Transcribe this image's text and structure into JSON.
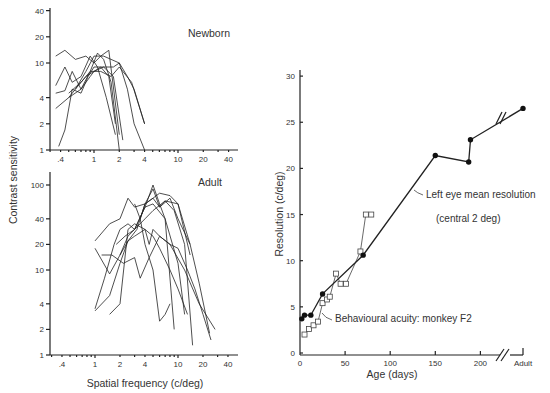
{
  "chart_data": [
    {
      "id": "newborn",
      "type": "line",
      "title": "Newborn",
      "xlabel": "Spatial frequency (c/deg)",
      "ylabel": "Contrast sensitivity",
      "xscale": "log",
      "yscale": "log",
      "xticks": [
        0.4,
        1,
        2,
        4,
        10,
        20,
        40
      ],
      "xtick_labels": [
        ".4",
        "1",
        "2",
        "4",
        "10",
        "20",
        "40"
      ],
      "yticks": [
        1,
        2,
        4,
        10,
        20,
        40
      ],
      "ytick_labels": [
        "1",
        "2",
        "4",
        "10",
        "20",
        "40"
      ],
      "xlim": [
        0.3,
        40
      ],
      "ylim": [
        1,
        40
      ],
      "series": [
        {
          "name": "n1",
          "x": [
            0.35,
            0.45,
            0.6,
            0.8,
            1.0,
            1.2,
            1.5,
            2.0
          ],
          "y": [
            12,
            14,
            11,
            12,
            10,
            12,
            14,
            1.5
          ]
        },
        {
          "name": "n2",
          "x": [
            0.35,
            0.45,
            0.55,
            0.7,
            0.9,
            1.1,
            1.4,
            1.8
          ],
          "y": [
            5.5,
            9,
            6,
            7,
            12,
            9,
            4,
            1.5
          ]
        },
        {
          "name": "n3",
          "x": [
            0.35,
            0.45,
            0.55,
            0.7,
            0.9,
            1.1,
            1.3,
            1.6,
            2.0
          ],
          "y": [
            4.5,
            4.8,
            8,
            5,
            8,
            13,
            11,
            6,
            1
          ]
        },
        {
          "name": "n4",
          "x": [
            0.35,
            0.5,
            0.7,
            0.9,
            1.0,
            1.2,
            1.5,
            1.8
          ],
          "y": [
            3,
            4,
            5,
            7,
            8,
            9,
            7,
            2
          ]
        },
        {
          "name": "n5",
          "x": [
            0.38,
            0.45,
            0.55,
            0.7,
            0.85,
            1.0,
            1.3,
            1.7,
            2.2
          ],
          "y": [
            1.1,
            1.7,
            5,
            4.5,
            7,
            9,
            9,
            7,
            1.3
          ]
        },
        {
          "name": "n6",
          "x": [
            0.5,
            0.6,
            0.8,
            1.0,
            1.3,
            2.0,
            2.5,
            3.0,
            4.0
          ],
          "y": [
            4,
            5,
            8,
            12,
            12,
            10,
            7,
            5,
            2
          ]
        },
        {
          "name": "n7",
          "x": [
            0.6,
            0.8,
            1.0,
            1.3,
            1.7,
            2.0,
            2.5,
            3.0,
            4.0
          ],
          "y": [
            5,
            7,
            8,
            9,
            9,
            10,
            5,
            2,
            1
          ]
        },
        {
          "name": "n8",
          "x": [
            0.5,
            0.7,
            0.9,
            1.2,
            1.6,
            2.0,
            2.8,
            4.0
          ],
          "y": [
            4.5,
            6,
            8,
            8,
            7,
            9,
            6,
            2
          ]
        }
      ]
    },
    {
      "id": "adult",
      "type": "line",
      "title": "Adult",
      "xlabel": "Spatial frequency (c/deg)",
      "ylabel": "Contrast sensitivity",
      "xscale": "log",
      "yscale": "log",
      "xticks": [
        0.4,
        1,
        2,
        4,
        10,
        20,
        40
      ],
      "xtick_labels": [
        ".4",
        "1",
        "2",
        "4",
        "10",
        "20",
        "40"
      ],
      "yticks": [
        1,
        2,
        4,
        10,
        20,
        40,
        100
      ],
      "ytick_labels": [
        "1",
        "2",
        "4",
        "10",
        "20",
        "40",
        "100"
      ],
      "xlim": [
        0.3,
        40
      ],
      "ylim": [
        1,
        120
      ],
      "series": [
        {
          "name": "a1",
          "x": [
            1,
            1.5,
            2,
            2.5,
            3,
            4,
            5,
            6,
            8,
            10,
            14
          ],
          "y": [
            22,
            35,
            40,
            70,
            55,
            60,
            90,
            55,
            70,
            40,
            20
          ]
        },
        {
          "name": "a2",
          "x": [
            1,
            1.3,
            1.7,
            2,
            2.5,
            3,
            4,
            5,
            7,
            10,
            12
          ],
          "y": [
            3.5,
            8,
            20,
            30,
            35,
            30,
            55,
            60,
            40,
            12,
            3
          ]
        },
        {
          "name": "a3",
          "x": [
            1,
            1.5,
            2,
            2.5,
            3,
            4,
            5,
            7,
            10,
            14
          ],
          "y": [
            18,
            9,
            15,
            25,
            30,
            40,
            50,
            65,
            60,
            15
          ]
        },
        {
          "name": "a4",
          "x": [
            1,
            1.5,
            2,
            2.5,
            3.2,
            4,
            5,
            6,
            7,
            9,
            12,
            15
          ],
          "y": [
            3.3,
            5,
            12,
            22,
            30,
            60,
            70,
            55,
            65,
            50,
            20,
            1.3
          ]
        },
        {
          "name": "a5",
          "x": [
            1.5,
            2,
            2.5,
            3,
            4,
            4.5,
            5,
            6,
            8,
            10,
            13,
            16,
            20,
            25
          ],
          "y": [
            3,
            4,
            30,
            35,
            30,
            20,
            30,
            25,
            20,
            18,
            10,
            6,
            3,
            1.5
          ]
        },
        {
          "name": "a6",
          "x": [
            1.2,
            1.6,
            2.2,
            3,
            3.5,
            4.5,
            6,
            8,
            12,
            18,
            28
          ],
          "y": [
            15,
            15,
            12,
            14,
            8,
            14,
            25,
            20,
            10,
            4,
            2
          ]
        },
        {
          "name": "a7",
          "x": [
            1.8,
            2.3,
            3,
            4,
            5,
            6,
            7,
            9
          ],
          "y": [
            20,
            25,
            30,
            55,
            100,
            60,
            40,
            2
          ]
        },
        {
          "name": "a8",
          "x": [
            2,
            2.5,
            3,
            4,
            5,
            6,
            8,
            10,
            13
          ],
          "y": [
            15,
            22,
            25,
            30,
            25,
            18,
            10,
            6,
            3
          ]
        },
        {
          "name": "a9",
          "x": [
            3,
            3.5,
            4,
            5,
            6,
            7,
            8
          ],
          "y": [
            60,
            40,
            20,
            10,
            2.5,
            3,
            4
          ]
        },
        {
          "name": "a10",
          "x": [
            3.5,
            4,
            5,
            6,
            8,
            10,
            14,
            18,
            24
          ],
          "y": [
            40,
            60,
            70,
            80,
            75,
            60,
            20,
            7,
            1.8
          ]
        }
      ]
    },
    {
      "id": "resolution",
      "type": "line",
      "title": "",
      "xlabel": "Age (days)",
      "ylabel": "Resolution (c/deg)",
      "xticks": [
        0,
        50,
        100,
        150,
        200
      ],
      "xtick_labels": [
        "0",
        "50",
        "100",
        "150",
        "200"
      ],
      "x_break_label": "Adult",
      "yticks": [
        0,
        5,
        10,
        15,
        20,
        25,
        30
      ],
      "ytick_labels": [
        "0",
        "5",
        "10",
        "15",
        "20",
        "25",
        "30"
      ],
      "xlim": [
        0,
        225
      ],
      "ylim": [
        0,
        30
      ],
      "grid": false,
      "series": [
        {
          "name": "Left eye mean resolution (central 2 deg)",
          "marker": "filled-circle",
          "x": [
            2,
            5,
            12,
            25,
            70,
            150,
            187,
            189,
            "Adult"
          ],
          "y": [
            3.7,
            4.1,
            4.1,
            6.4,
            10.6,
            21.4,
            20.7,
            23.1,
            26.5
          ]
        },
        {
          "name": "Behavioural acuity: monkey F2",
          "marker": "open-square",
          "x": [
            5,
            10,
            15,
            20,
            25,
            30,
            33,
            40,
            45,
            51,
            67,
            73,
            79
          ],
          "y": [
            2.0,
            2.6,
            3.0,
            3.4,
            5.4,
            5.8,
            6.1,
            8.6,
            7.5,
            7.5,
            11.0,
            15.0,
            15.0
          ]
        }
      ],
      "annotations": [
        {
          "text": "Left eye mean resolution",
          "target_series": 0
        },
        {
          "text": "(central 2 deg)",
          "target_series": 0
        },
        {
          "text": "Behavioural acuity: monkey F2",
          "target_series": 1
        }
      ]
    }
  ],
  "labels": {
    "newborn_title": "Newborn",
    "adult_title": "Adult",
    "left_ylabel": "Contrast sensitivity",
    "left_xlabel": "Spatial frequency (c/deg)",
    "right_ylabel": "Resolution (c/deg)",
    "right_xlabel": "Age (days)",
    "right_adult_tick": "Adult",
    "ann_left_eye": "Left eye mean resolution",
    "ann_central": "(central 2 deg)",
    "ann_behav": "Behavioural acuity: monkey F2"
  }
}
